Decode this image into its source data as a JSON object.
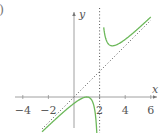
{
  "panel_label": ")",
  "chart_data": {
    "type": "line",
    "title": "",
    "xlabel": "x",
    "ylabel": "y",
    "xlim": [
      -4.6,
      6.3
    ],
    "ylim": [
      -2.4,
      6.5
    ],
    "x_ticks": [
      -4,
      -2,
      2,
      4,
      6
    ],
    "x_tick_labels": [
      "−4",
      "−2",
      "2",
      "4",
      "6"
    ],
    "grid": false,
    "legend": null,
    "series": [
      {
        "name": "f(x) = x + 1/(x - 2)",
        "style": "solid",
        "color": "#6cb85a",
        "x": [
          -2.5,
          -2,
          -1,
          0,
          0.5,
          1,
          1.3,
          1.5,
          1.65,
          3.0,
          2.35,
          2.5,
          2.7,
          3,
          3.5,
          4,
          5,
          6
        ],
        "y": [
          -2.72,
          -2.25,
          -1.33,
          -0.5,
          -0.17,
          0,
          -0.13,
          -0.5,
          -1.21,
          4.0,
          5.21,
          4.5,
          4.13,
          4.0,
          4.17,
          4.5,
          5.33,
          6.25
        ]
      },
      {
        "name": "oblique asymptote y = x",
        "style": "dotted",
        "color": "#555555",
        "x": [
          -2.5,
          6
        ],
        "y": [
          -2.5,
          6
        ]
      },
      {
        "name": "vertical asymptote x = 2",
        "style": "dotted",
        "color": "#555555",
        "x": [
          2,
          2
        ],
        "y": [
          -2.4,
          6.5
        ]
      }
    ]
  },
  "colors": {
    "curve": "#6cb85a",
    "axes": "#888888",
    "text": "#555555",
    "asymptote": "#555555"
  }
}
